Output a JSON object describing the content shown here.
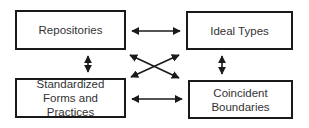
{
  "diagram": {
    "nodes": [
      {
        "id": "repositories",
        "label": "Repositories"
      },
      {
        "id": "ideal-types",
        "label": "Ideal Types"
      },
      {
        "id": "standardized-forms",
        "label": "Standardized Forms and Practices"
      },
      {
        "id": "coincident-boundaries",
        "label": "Coincident Boundaries"
      }
    ],
    "edges": [
      {
        "from": "repositories",
        "to": "ideal-types",
        "type": "bidirectional"
      },
      {
        "from": "standardized-forms",
        "to": "coincident-boundaries",
        "type": "bidirectional"
      },
      {
        "from": "repositories",
        "to": "standardized-forms",
        "type": "bidirectional"
      },
      {
        "from": "ideal-types",
        "to": "coincident-boundaries",
        "type": "bidirectional"
      },
      {
        "from": "repositories",
        "to": "coincident-boundaries",
        "type": "bidirectional"
      },
      {
        "from": "ideal-types",
        "to": "standardized-forms",
        "type": "bidirectional"
      }
    ],
    "colors": {
      "stroke": "#1a1a1a",
      "text": "#333333",
      "background": "#ffffff"
    }
  }
}
